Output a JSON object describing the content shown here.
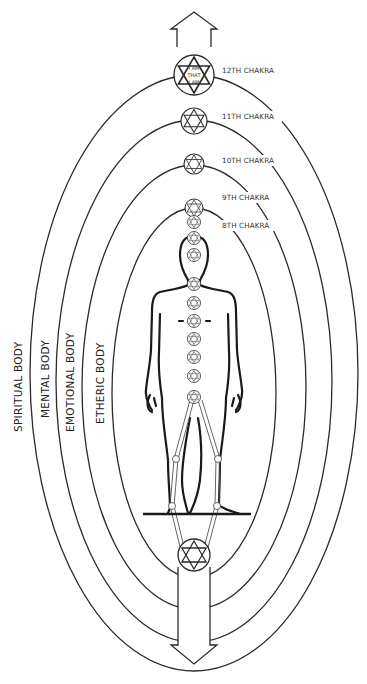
{
  "diagram": {
    "chakra_labels": [
      {
        "label": "12TH CHAKRA",
        "inner_text": [
          "I AM",
          "THAT",
          "I AM"
        ]
      },
      {
        "label": "11TH CHAKRA"
      },
      {
        "label": "10TH CHAKRA"
      },
      {
        "label": "9TH CHAKRA"
      },
      {
        "label": "8TH CHAKRA"
      }
    ],
    "body_labels": [
      {
        "label": "SPIRITUAL BODY"
      },
      {
        "label": "MENTAL BODY"
      },
      {
        "label": "EMOTIONAL BODY"
      },
      {
        "label": "ETHERIC BODY"
      }
    ],
    "arrows": {
      "top": "up-arrow",
      "bottom": "down-arrow"
    },
    "colors": {
      "line": "#2a2a2a",
      "background": "#ffffff",
      "text": "#333333"
    }
  }
}
